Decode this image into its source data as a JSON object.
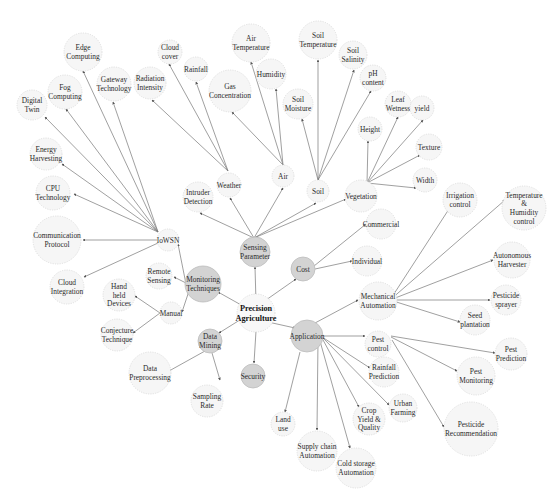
{
  "diagram": {
    "colors": {
      "edge": "#777777",
      "light_node": "#f6f6f6",
      "dark_node": "#d3d3d3",
      "text": "#2b2b2b"
    },
    "nodes": [
      {
        "id": "root",
        "label": [
          "Precision",
          "Agriculture"
        ],
        "x": 256,
        "y": 313,
        "r": 19,
        "type": "root"
      },
      {
        "id": "sensing",
        "label": [
          "Sensing",
          "Parameter"
        ],
        "x": 255,
        "y": 252,
        "r": 15,
        "type": "dark"
      },
      {
        "id": "monitoring",
        "label": [
          "Monitoring",
          "Techniques"
        ],
        "x": 203,
        "y": 284,
        "r": 18,
        "type": "dark"
      },
      {
        "id": "datamining",
        "label": [
          "Data",
          "Mining"
        ],
        "x": 210,
        "y": 341,
        "r": 12,
        "type": "dark"
      },
      {
        "id": "security",
        "label": [
          "Security"
        ],
        "x": 253,
        "y": 376,
        "r": 12,
        "type": "dark"
      },
      {
        "id": "cost",
        "label": [
          "Cost"
        ],
        "x": 303,
        "y": 269,
        "r": 12,
        "type": "dark"
      },
      {
        "id": "application",
        "label": [
          "Application"
        ],
        "x": 307,
        "y": 336,
        "r": 16,
        "type": "dark"
      },
      {
        "id": "intruder",
        "label": [
          "Intruder",
          "Detection"
        ],
        "x": 198,
        "y": 197,
        "r": 15,
        "type": "light"
      },
      {
        "id": "weather",
        "label": [
          "Weather"
        ],
        "x": 229,
        "y": 185,
        "r": 12,
        "type": "light"
      },
      {
        "id": "air",
        "label": [
          "Air"
        ],
        "x": 283,
        "y": 176,
        "r": 11,
        "type": "light"
      },
      {
        "id": "soil",
        "label": [
          "Soil"
        ],
        "x": 318,
        "y": 191,
        "r": 11,
        "type": "light"
      },
      {
        "id": "vegetation",
        "label": [
          "Vegetation"
        ],
        "x": 361,
        "y": 196,
        "r": 16,
        "type": "light"
      },
      {
        "id": "cloudcover",
        "label": [
          "Cloud",
          "cover"
        ],
        "x": 170,
        "y": 52,
        "r": 12,
        "type": "light"
      },
      {
        "id": "rainfall",
        "label": [
          "Rainfall"
        ],
        "x": 196,
        "y": 69,
        "r": 12,
        "type": "light"
      },
      {
        "id": "radiation",
        "label": [
          "Radiation",
          "Intensity"
        ],
        "x": 150,
        "y": 83,
        "r": 16,
        "type": "light"
      },
      {
        "id": "gas",
        "label": [
          "Gas",
          "Concentration"
        ],
        "x": 230,
        "y": 91,
        "r": 21,
        "type": "light"
      },
      {
        "id": "airtemp",
        "label": [
          "Air",
          "Temperature"
        ],
        "x": 251,
        "y": 43,
        "r": 19,
        "type": "light"
      },
      {
        "id": "humidity",
        "label": [
          "Humidity"
        ],
        "x": 271,
        "y": 74,
        "r": 15,
        "type": "light"
      },
      {
        "id": "soiltemp",
        "label": [
          "Soil",
          "Temperature"
        ],
        "x": 318,
        "y": 40,
        "r": 19,
        "type": "light"
      },
      {
        "id": "soilmoisture",
        "label": [
          "Soil",
          "Moisture"
        ],
        "x": 298,
        "y": 104,
        "r": 15,
        "type": "light"
      },
      {
        "id": "soilsalinity",
        "label": [
          "Soil",
          "Salinity"
        ],
        "x": 353,
        "y": 55,
        "r": 14,
        "type": "light"
      },
      {
        "id": "ph",
        "label": [
          "pH",
          "content"
        ],
        "x": 373,
        "y": 78,
        "r": 13,
        "type": "light"
      },
      {
        "id": "height",
        "label": [
          "Height"
        ],
        "x": 370,
        "y": 129,
        "r": 12,
        "type": "light"
      },
      {
        "id": "leafwet",
        "label": [
          "Leaf",
          "Wetness"
        ],
        "x": 398,
        "y": 104,
        "r": 13,
        "type": "light"
      },
      {
        "id": "yield",
        "label": [
          "yield"
        ],
        "x": 422,
        "y": 108,
        "r": 12,
        "type": "light"
      },
      {
        "id": "texture",
        "label": [
          "Texture"
        ],
        "x": 429,
        "y": 147,
        "r": 13,
        "type": "light"
      },
      {
        "id": "width",
        "label": [
          "Width"
        ],
        "x": 425,
        "y": 180,
        "r": 12,
        "type": "light"
      },
      {
        "id": "edge",
        "label": [
          "Edge",
          "Computing"
        ],
        "x": 83,
        "y": 52,
        "r": 19,
        "type": "light"
      },
      {
        "id": "fog",
        "label": [
          "Fog",
          "Computing"
        ],
        "x": 65,
        "y": 92,
        "r": 17,
        "type": "light"
      },
      {
        "id": "gateway",
        "label": [
          "Gateway",
          "Technology"
        ],
        "x": 114,
        "y": 84,
        "r": 17,
        "type": "light"
      },
      {
        "id": "digitaltwin",
        "label": [
          "Digital",
          "Twin"
        ],
        "x": 32,
        "y": 105,
        "r": 15,
        "type": "light"
      },
      {
        "id": "energy",
        "label": [
          "Energy",
          "Harvesting"
        ],
        "x": 46,
        "y": 154,
        "r": 16,
        "type": "light"
      },
      {
        "id": "cpu",
        "label": [
          "CPU",
          "Technology"
        ],
        "x": 53,
        "y": 193,
        "r": 17,
        "type": "light"
      },
      {
        "id": "comm",
        "label": [
          "Communication",
          "Protocol"
        ],
        "x": 57,
        "y": 240,
        "r": 24,
        "type": "light"
      },
      {
        "id": "cloudint",
        "label": [
          "Cloud",
          "Integration"
        ],
        "x": 67,
        "y": 287,
        "r": 17,
        "type": "light"
      },
      {
        "id": "iowsn",
        "label": [
          "IoWSN"
        ],
        "x": 168,
        "y": 240,
        "r": 11,
        "type": "light"
      },
      {
        "id": "remote",
        "label": [
          "Remote",
          "Sensing"
        ],
        "x": 159,
        "y": 276,
        "r": 13,
        "type": "light"
      },
      {
        "id": "manual",
        "label": [
          "Manual"
        ],
        "x": 171,
        "y": 313,
        "r": 11,
        "type": "light"
      },
      {
        "id": "handheld",
        "label": [
          "Hand",
          "held",
          "Devices"
        ],
        "x": 119,
        "y": 295,
        "r": 16,
        "type": "light"
      },
      {
        "id": "conjecture",
        "label": [
          "Conjecture",
          "Technique"
        ],
        "x": 117,
        "y": 335,
        "r": 16,
        "type": "light"
      },
      {
        "id": "preproc",
        "label": [
          "Data",
          "Preprocessing"
        ],
        "x": 150,
        "y": 373,
        "r": 21,
        "type": "light"
      },
      {
        "id": "sampling",
        "label": [
          "Sampling",
          "Rate"
        ],
        "x": 207,
        "y": 401,
        "r": 16,
        "type": "light"
      },
      {
        "id": "commercial",
        "label": [
          "Commercial"
        ],
        "x": 381,
        "y": 224,
        "r": 15,
        "type": "light"
      },
      {
        "id": "individual",
        "label": [
          "Individual"
        ],
        "x": 367,
        "y": 261,
        "r": 15,
        "type": "light"
      },
      {
        "id": "mechanical",
        "label": [
          "Mechanical",
          "Automation"
        ],
        "x": 378,
        "y": 301,
        "r": 19,
        "type": "light"
      },
      {
        "id": "irrigation",
        "label": [
          "Irrigation",
          "control"
        ],
        "x": 460,
        "y": 200,
        "r": 17,
        "type": "light"
      },
      {
        "id": "temphum",
        "label": [
          "Temperature",
          "&",
          "Humidity",
          "control"
        ],
        "x": 524,
        "y": 208,
        "r": 22,
        "type": "light"
      },
      {
        "id": "autoharv",
        "label": [
          "Autonomous",
          "Harvester"
        ],
        "x": 512,
        "y": 260,
        "r": 18,
        "type": "light"
      },
      {
        "id": "pestspray",
        "label": [
          "Pesticide",
          "sprayer"
        ],
        "x": 506,
        "y": 300,
        "r": 15,
        "type": "light"
      },
      {
        "id": "seed",
        "label": [
          "Seed",
          "plantation"
        ],
        "x": 475,
        "y": 320,
        "r": 15,
        "type": "light"
      },
      {
        "id": "pestcontrol",
        "label": [
          "Pest",
          "control"
        ],
        "x": 378,
        "y": 344,
        "r": 13,
        "type": "light"
      },
      {
        "id": "rainpred",
        "label": [
          "Rainfall",
          "Prediction"
        ],
        "x": 384,
        "y": 372,
        "r": 15,
        "type": "light"
      },
      {
        "id": "urban",
        "label": [
          "Urban",
          "Farming"
        ],
        "x": 403,
        "y": 408,
        "r": 14,
        "type": "light"
      },
      {
        "id": "crop",
        "label": [
          "Crop",
          "Yield &",
          "Quality"
        ],
        "x": 369,
        "y": 419,
        "r": 16,
        "type": "light"
      },
      {
        "id": "landuse",
        "label": [
          "Land",
          "use"
        ],
        "x": 283,
        "y": 424,
        "r": 12,
        "type": "light"
      },
      {
        "id": "supply",
        "label": [
          "Supply chain",
          "Automation"
        ],
        "x": 317,
        "y": 451,
        "r": 20,
        "type": "light"
      },
      {
        "id": "coldstorage",
        "label": [
          "Cold storage",
          "Automation"
        ],
        "x": 356,
        "y": 468,
        "r": 20,
        "type": "light"
      },
      {
        "id": "pestpred",
        "label": [
          "Pest",
          "Prediction"
        ],
        "x": 511,
        "y": 354,
        "r": 16,
        "type": "light"
      },
      {
        "id": "pestmon",
        "label": [
          "Pest",
          "Monitoring"
        ],
        "x": 476,
        "y": 376,
        "r": 19,
        "type": "light"
      },
      {
        "id": "pesticiderec",
        "label": [
          "Pesticide",
          "Recommendation"
        ],
        "x": 471,
        "y": 429,
        "r": 27,
        "type": "light"
      }
    ],
    "edges": [
      {
        "from": [
          256,
          302
        ],
        "to": [
          255,
          267
        ]
      },
      {
        "from": [
          243,
          306
        ],
        "to": [
          218,
          292
        ]
      },
      {
        "from": [
          243,
          318
        ],
        "to": [
          219,
          333
        ]
      },
      {
        "from": [
          256,
          331
        ],
        "to": [
          254,
          363
        ]
      },
      {
        "from": [
          266,
          300
        ],
        "to": [
          296,
          279
        ]
      },
      {
        "from": [
          268,
          322
        ],
        "to": [
          295,
          328
        ]
      },
      {
        "from": [
          254,
          238
        ],
        "to": [
          200,
          213
        ]
      },
      {
        "from": [
          254,
          238
        ],
        "to": [
          230,
          198
        ]
      },
      {
        "from": [
          254,
          238
        ],
        "to": [
          283,
          188
        ]
      },
      {
        "from": [
          254,
          238
        ],
        "to": [
          316,
          203
        ]
      },
      {
        "from": [
          254,
          238
        ],
        "to": [
          346,
          199
        ]
      },
      {
        "from": [
          228,
          171
        ],
        "to": [
          169,
          64
        ]
      },
      {
        "from": [
          228,
          171
        ],
        "to": [
          196,
          82
        ]
      },
      {
        "from": [
          228,
          171
        ],
        "to": [
          152,
          100
        ]
      },
      {
        "from": [
          283,
          165
        ],
        "to": [
          251,
          62
        ]
      },
      {
        "from": [
          283,
          165
        ],
        "to": [
          276,
          89
        ]
      },
      {
        "from": [
          283,
          165
        ],
        "to": [
          232,
          112
        ]
      },
      {
        "from": [
          318,
          180
        ],
        "to": [
          318,
          60
        ]
      },
      {
        "from": [
          318,
          180
        ],
        "to": [
          302,
          119
        ]
      },
      {
        "from": [
          318,
          180
        ],
        "to": [
          354,
          70
        ]
      },
      {
        "from": [
          318,
          180
        ],
        "to": [
          371,
          91
        ]
      },
      {
        "from": [
          367,
          183
        ],
        "to": [
          368,
          141
        ]
      },
      {
        "from": [
          367,
          183
        ],
        "to": [
          398,
          117
        ]
      },
      {
        "from": [
          367,
          183
        ],
        "to": [
          423,
          120
        ]
      },
      {
        "from": [
          367,
          183
        ],
        "to": [
          420,
          155
        ]
      },
      {
        "from": [
          367,
          183
        ],
        "to": [
          416,
          188
        ]
      },
      {
        "from": [
          158,
          232
        ],
        "to": [
          83,
          71
        ]
      },
      {
        "from": [
          158,
          232
        ],
        "to": [
          66,
          109
        ]
      },
      {
        "from": [
          158,
          232
        ],
        "to": [
          113,
          102
        ]
      },
      {
        "from": [
          158,
          232
        ],
        "to": [
          45,
          117
        ]
      },
      {
        "from": [
          158,
          232
        ],
        "to": [
          62,
          164
        ]
      },
      {
        "from": [
          158,
          232
        ],
        "to": [
          74,
          194
        ]
      },
      {
        "from": [
          158,
          240
        ],
        "to": [
          83,
          240
        ]
      },
      {
        "from": [
          158,
          243
        ],
        "to": [
          84,
          277
        ]
      },
      {
        "from": [
          186,
          283
        ],
        "to": [
          174,
          277
        ]
      },
      {
        "from": [
          188,
          294
        ],
        "to": [
          178,
          244
        ]
      },
      {
        "from": [
          188,
          294
        ],
        "to": [
          182,
          312
        ]
      },
      {
        "from": [
          160,
          313
        ],
        "to": [
          135,
          296
        ]
      },
      {
        "from": [
          160,
          313
        ],
        "to": [
          133,
          333
        ]
      },
      {
        "from": [
          205,
          351
        ],
        "to": [
          169,
          371
        ]
      },
      {
        "from": [
          212,
          353
        ],
        "to": [
          220,
          380
        ]
      },
      {
        "from": [
          314,
          266
        ],
        "to": [
          366,
          224
        ]
      },
      {
        "from": [
          315,
          269
        ],
        "to": [
          352,
          261
        ]
      },
      {
        "from": [
          315,
          323
        ],
        "to": [
          358,
          300
        ]
      },
      {
        "from": [
          390,
          300
        ],
        "to": [
          449,
          209
        ]
      },
      {
        "from": [
          390,
          300
        ],
        "to": [
          505,
          200
        ]
      },
      {
        "from": [
          390,
          300
        ],
        "to": [
          493,
          260
        ]
      },
      {
        "from": [
          390,
          300
        ],
        "to": [
          490,
          300
        ]
      },
      {
        "from": [
          390,
          300
        ],
        "to": [
          460,
          322
        ]
      },
      {
        "from": [
          322,
          336
        ],
        "to": [
          365,
          336
        ]
      },
      {
        "from": [
          322,
          337
        ],
        "to": [
          370,
          368
        ]
      },
      {
        "from": [
          322,
          337
        ],
        "to": [
          389,
          405
        ]
      },
      {
        "from": [
          322,
          338
        ],
        "to": [
          359,
          407
        ]
      },
      {
        "from": [
          300,
          352
        ],
        "to": [
          285,
          412
        ]
      },
      {
        "from": [
          318,
          340
        ],
        "to": [
          317,
          430
        ]
      },
      {
        "from": [
          320,
          341
        ],
        "to": [
          350,
          448
        ]
      },
      {
        "from": [
          391,
          336
        ],
        "to": [
          495,
          353
        ]
      },
      {
        "from": [
          391,
          337
        ],
        "to": [
          457,
          371
        ]
      },
      {
        "from": [
          392,
          340
        ],
        "to": [
          444,
          427
        ]
      }
    ]
  }
}
